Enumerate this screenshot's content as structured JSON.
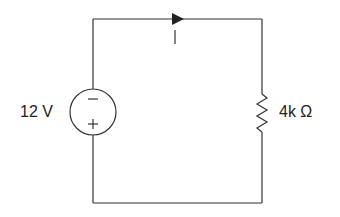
{
  "diagram": {
    "type": "circuit",
    "source": {
      "label": "12 V",
      "top_polarity": "−",
      "bottom_polarity": "+"
    },
    "resistor": {
      "label": "4k Ω"
    },
    "current": {
      "label": "I",
      "direction": "clockwise-right"
    },
    "colors": {
      "wire": "#333333",
      "background": "#ffffff"
    }
  }
}
